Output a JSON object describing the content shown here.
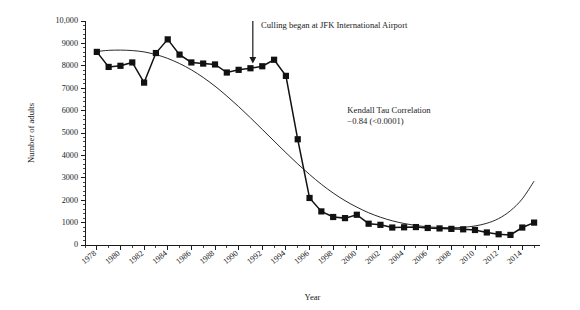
{
  "chart_data": {
    "type": "line",
    "title": "",
    "xlabel": "Year",
    "ylabel": "Number of adults",
    "xlim": [
      1977,
      2015.5
    ],
    "ylim": [
      0,
      10000
    ],
    "grid": false,
    "legend": null,
    "y_ticks": [
      0,
      1000,
      2000,
      3000,
      4000,
      5000,
      6000,
      7000,
      8000,
      9000,
      10000
    ],
    "y_tick_labels": [
      "0",
      "1000",
      "2000",
      "3000",
      "4000",
      "5000",
      "6000",
      "7000",
      "8000",
      "9000",
      "10,000"
    ],
    "y_minor_step": 200,
    "x_ticks": [
      1978,
      1980,
      1982,
      1984,
      1986,
      1988,
      1990,
      1992,
      1994,
      1996,
      1998,
      2000,
      2002,
      2004,
      2006,
      2008,
      2010,
      2012,
      2014
    ],
    "x_tick_labels": [
      "1978",
      "1980",
      "1982",
      "1984",
      "1986",
      "1988",
      "1990",
      "1992",
      "1994",
      "1996",
      "1998",
      "2000",
      "2002",
      "2004",
      "2006",
      "2008",
      "2010",
      "2012",
      "2014"
    ],
    "x_minor_step": 1,
    "series": [
      {
        "name": "Number of adults",
        "marker": "square",
        "x": [
          1978,
          1979,
          1980,
          1981,
          1982,
          1983,
          1984,
          1985,
          1986,
          1987,
          1988,
          1989,
          1990,
          1991,
          1992,
          1993,
          1994,
          1995,
          1996,
          1997,
          1998,
          1999,
          2000,
          2001,
          2002,
          2003,
          2004,
          2005,
          2006,
          2007,
          2008,
          2009,
          2010,
          2011,
          2012,
          2013,
          2014,
          2015
        ],
        "values": [
          8620,
          7950,
          8000,
          8150,
          7250,
          8570,
          9180,
          8500,
          8150,
          8100,
          8060,
          7700,
          7820,
          7890,
          7980,
          8270,
          7550,
          4720,
          2100,
          1500,
          1250,
          1200,
          1350,
          950,
          900,
          780,
          790,
          800,
          760,
          740,
          720,
          700,
          670,
          560,
          480,
          450,
          780,
          1000
        ]
      }
    ],
    "trend": {
      "name": "fitted trend curve",
      "x": [
        1978,
        1979,
        1980,
        1981,
        1982,
        1983,
        1984,
        1985,
        1986,
        1987,
        1988,
        1989,
        1990,
        1991,
        1992,
        1993,
        1994,
        1995,
        1996,
        1997,
        1998,
        1999,
        2000,
        2001,
        2002,
        2003,
        2004,
        2005,
        2006,
        2007,
        2008,
        2009,
        2010,
        2011,
        2012,
        2013,
        2014,
        2015
      ],
      "values": [
        8640,
        8690,
        8700,
        8680,
        8620,
        8500,
        8330,
        8100,
        7820,
        7480,
        7090,
        6650,
        6180,
        5680,
        5160,
        4640,
        4120,
        3620,
        3150,
        2710,
        2320,
        1980,
        1690,
        1440,
        1240,
        1080,
        960,
        870,
        810,
        780,
        770,
        790,
        850,
        970,
        1180,
        1530,
        2060,
        2850
      ]
    },
    "annotations": [
      {
        "name": "culling-annotation",
        "text": "Culling began at JFK International Airport",
        "arrow_x": 1991.2,
        "arrow_y_top": 10000,
        "arrow_y_bottom": 8100,
        "text_x": 1991.9,
        "text_y": 9680
      },
      {
        "name": "kendall-tau-annotation",
        "line1": "Kendall Tau Correlation",
        "line2": "−0.84 (<0.0001)",
        "text_x": 1999.2,
        "text_y": 5900
      }
    ]
  },
  "colors": {
    "ink": "#1a1a1a",
    "marker": "#111111",
    "background": "#ffffff"
  }
}
